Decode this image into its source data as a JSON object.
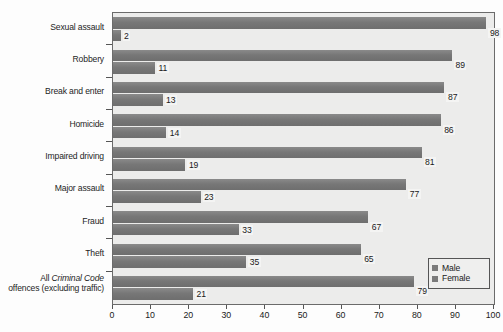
{
  "chart_data": {
    "type": "bar",
    "orientation": "horizontal",
    "title": "",
    "subtitle": "",
    "xlabel": "",
    "ylabel": "",
    "xlim": [
      0,
      100
    ],
    "xticks": [
      0,
      10,
      20,
      30,
      40,
      50,
      60,
      70,
      80,
      90,
      100
    ],
    "xtick_labels": [
      "0",
      "10",
      "20",
      "30",
      "40",
      "50",
      "60",
      "70",
      "80",
      "90",
      "100"
    ],
    "grid": false,
    "legend_position": "bottom-right",
    "categories": [
      "Sexual assault",
      "Robbery",
      "Break and enter",
      "Homicide",
      "Impaired driving",
      "Major assault",
      "Fraud",
      "Theft",
      "All Criminal Code offences (excluding traffic)"
    ],
    "category_labels": [
      {
        "text": "Sexual assault",
        "italic_part": ""
      },
      {
        "text": "Robbery",
        "italic_part": ""
      },
      {
        "text": "Break and enter",
        "italic_part": ""
      },
      {
        "text": "Homicide",
        "italic_part": ""
      },
      {
        "text": "Impaired driving",
        "italic_part": ""
      },
      {
        "text": "Major assault",
        "italic_part": ""
      },
      {
        "text": "Fraud",
        "italic_part": ""
      },
      {
        "text": "Theft",
        "italic_part": ""
      },
      {
        "text": "All Criminal Code offences (excluding traffic)",
        "italic_part": "Criminal Code"
      }
    ],
    "series": [
      {
        "name": "Male",
        "color": "#7b7b7b",
        "values": [
          98,
          89,
          87,
          86,
          81,
          77,
          67,
          65,
          79
        ]
      },
      {
        "name": "Female",
        "color": "#7b7b7b",
        "values": [
          2,
          11,
          13,
          14,
          19,
          23,
          33,
          35,
          21
        ]
      }
    ],
    "value_labels": {
      "male": [
        "98",
        "89",
        "87",
        "86",
        "81",
        "77",
        "67",
        "65",
        "79"
      ],
      "female": [
        "2",
        "11",
        "13",
        "14",
        "19",
        "23",
        "33",
        "35",
        "21"
      ]
    },
    "legend": [
      "Male",
      "Female"
    ],
    "colors": {
      "bar": "#7b7b7b",
      "plot_background": "#ececeb",
      "page_background": "#fdfdfd",
      "axis": "#555555",
      "text": "#1a1a1a"
    }
  },
  "legend": {
    "items": [
      {
        "label": "Male",
        "color": "#7b7b7b"
      },
      {
        "label": "Female",
        "color": "#7b7b7b"
      }
    ]
  },
  "label_lines": {
    "all_criminal_code": {
      "line1_pre": "All ",
      "line1_italic": "Criminal Code",
      "line2": "offences (excluding traffic)"
    }
  }
}
